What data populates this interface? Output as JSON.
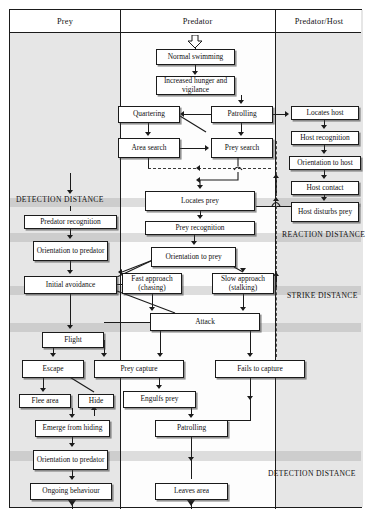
{
  "figure": {
    "type": "flowchart"
  },
  "columns": [
    {
      "id": "prey",
      "label": "Prey"
    },
    {
      "id": "predator",
      "label": "Predator"
    },
    {
      "id": "predator_host",
      "label": "Predator/Host"
    }
  ],
  "zone_labels": [
    {
      "id": "detection_upper",
      "label": "DETECTION DISTANCE"
    },
    {
      "id": "reaction",
      "label": "REACTION DISTANCE"
    },
    {
      "id": "strike",
      "label": "STRIKE DISTANCE"
    },
    {
      "id": "detection_lower",
      "label": "DETECTION DISTANCE"
    }
  ],
  "nodes": {
    "normal_swimming": "Normal swimming",
    "increased_hunger": "Increased hunger and vigilance",
    "quartering": "Quartering",
    "patrolling": "Patrolling",
    "area_search": "Area search",
    "prey_search": "Prey search",
    "locates_host": "Locates host",
    "host_recognition": "Host recognition",
    "orientation_to_host": "Orientation to host",
    "host_contact": "Host contact",
    "host_disturbs_prey": "Host disturbs prey",
    "locates_prey": "Locates prey",
    "prey_recognition": "Prey recognition",
    "predator_recognition": "Predator recognition",
    "orientation_to_predator": "Orientation to predator",
    "orientation_to_prey": "Orientation to prey",
    "initial_avoidance": "Initial avoidance",
    "fast_approach": "Fast approach (chasing)",
    "slow_approach": "Slow approach (stalking)",
    "attack": "Attack",
    "flight": "Flight",
    "escape": "Escape",
    "prey_capture": "Prey capture",
    "fails_to_capture": "Fails to capture",
    "flee_area": "Flee area",
    "hide": "Hide",
    "engulfs_prey": "Engulfs prey",
    "emerge_from_hiding": "Emerge from hiding",
    "patrolling_2": "Patrolling",
    "orientation_to_predator_2": "Orientation to predator",
    "ongoing_behaviour": "Ongoing behaviour",
    "leaves_area": "Leaves area"
  },
  "colors": {
    "ink": "#1b1b1b",
    "shaded_column": "#e6e6e6",
    "open_column": "#fdfdfd",
    "band": "rgba(150,150,150,0.30)",
    "page": "#ffffff"
  }
}
